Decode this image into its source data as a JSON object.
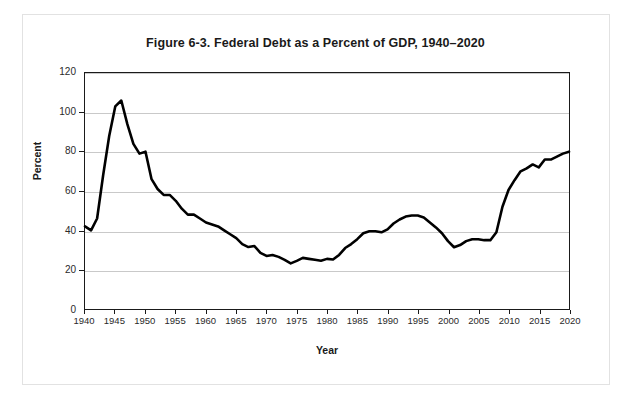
{
  "figure": {
    "title": "Figure 6-3. Federal Debt as a Percent of GDP, 1940–20"
  },
  "chart_data": {
    "type": "line",
    "title": "Figure 6-3. Federal Debt as a Percent of GDP, 1940–2020",
    "xlabel": "Year",
    "ylabel": "Percent",
    "xlim": [
      1940,
      2020
    ],
    "ylim": [
      0,
      120
    ],
    "grid": true,
    "legend": "none",
    "line_color": "#000000",
    "line_width": 2.6,
    "y_ticks": [
      0,
      20,
      40,
      60,
      80,
      100,
      120
    ],
    "x_ticks": [
      1940,
      1945,
      1950,
      1955,
      1960,
      1965,
      1970,
      1975,
      1980,
      1985,
      1990,
      1995,
      2000,
      2005,
      2010,
      2015,
      2020
    ],
    "series": [
      {
        "name": "Federal Debt as a Percent of GDP",
        "x": [
          1940,
          1941,
          1942,
          1943,
          1944,
          1945,
          1946,
          1947,
          1948,
          1949,
          1950,
          1951,
          1952,
          1953,
          1954,
          1955,
          1956,
          1957,
          1958,
          1959,
          1960,
          1961,
          1962,
          1963,
          1964,
          1965,
          1966,
          1967,
          1968,
          1969,
          1970,
          1971,
          1972,
          1973,
          1974,
          1975,
          1976,
          1977,
          1978,
          1979,
          1980,
          1981,
          1982,
          1983,
          1984,
          1985,
          1986,
          1987,
          1988,
          1989,
          1990,
          1991,
          1992,
          1993,
          1994,
          1995,
          1996,
          1997,
          1998,
          1999,
          2000,
          2001,
          2002,
          2003,
          2004,
          2005,
          2006,
          2007,
          2008,
          2009,
          2010,
          2011,
          2012,
          2013,
          2014,
          2015,
          2016,
          2017,
          2018,
          2019,
          2020
        ],
        "y": [
          42.0,
          40.0,
          46.0,
          68.0,
          88.0,
          103.0,
          106.0,
          94.0,
          84.0,
          79.0,
          80.0,
          66.0,
          61.0,
          58.0,
          58.0,
          55.0,
          51.0,
          48.0,
          48.0,
          46.0,
          44.0,
          43.0,
          42.0,
          40.0,
          38.0,
          36.0,
          33.0,
          31.5,
          32.0,
          28.5,
          27.0,
          27.5,
          26.5,
          25.0,
          23.2,
          24.5,
          26.0,
          25.5,
          25.0,
          24.5,
          25.5,
          25.2,
          27.5,
          31.0,
          33.0,
          35.5,
          38.5,
          39.5,
          39.5,
          39.0,
          40.5,
          43.5,
          45.5,
          47.0,
          47.5,
          47.5,
          46.5,
          44.0,
          41.5,
          38.5,
          34.5,
          31.4,
          32.5,
          34.5,
          35.5,
          35.5,
          35.0,
          35.0,
          39.0,
          52.0,
          60.5,
          65.5,
          70.0,
          71.5,
          73.5,
          72.0,
          76.0,
          76.0,
          77.5,
          79.0,
          80.0
        ]
      }
    ]
  },
  "axes": {
    "y_tick_labels": [
      "120",
      "100",
      "80",
      "60",
      "40",
      "20",
      "0"
    ],
    "x_tick_labels": [
      "1940",
      "1945",
      "1950",
      "1955",
      "1960",
      "1965",
      "1970",
      "1975",
      "1980",
      "1985",
      "1990",
      "1995",
      "2000",
      "2005",
      "2010",
      "2015",
      "2020"
    ],
    "y_title": "Percent",
    "x_title": "Year"
  }
}
